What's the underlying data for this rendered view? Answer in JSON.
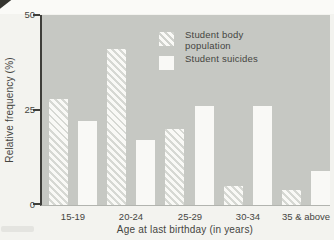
{
  "chart_data": {
    "type": "bar",
    "categories": [
      "15-19",
      "20-24",
      "25-29",
      "30-34",
      "35 & above"
    ],
    "series": [
      {
        "name": "Student body population",
        "label_lines": [
          "Student body",
          "population"
        ],
        "style": "hatched",
        "values": [
          28,
          41,
          20,
          5,
          4
        ]
      },
      {
        "name": "Student suicides",
        "label_lines": [
          "Student suicides"
        ],
        "style": "solid",
        "values": [
          22,
          17,
          26,
          26,
          9
        ]
      }
    ],
    "xlabel": "Age at last birthday (in years)",
    "ylabel": "Relative frequency (%)",
    "ylim": [
      0,
      50
    ],
    "yticks": [
      0,
      25,
      50
    ],
    "grid": false,
    "legend_position": "inside-top-right",
    "colors": {
      "plot_background": "#c6c8c3",
      "bar_fill": "#f9f9f6",
      "hatch_stripe": "#d6d8d3",
      "axis": "#3e3e3a",
      "text": "#45453f",
      "page_background": "#f3f3ef"
    }
  }
}
